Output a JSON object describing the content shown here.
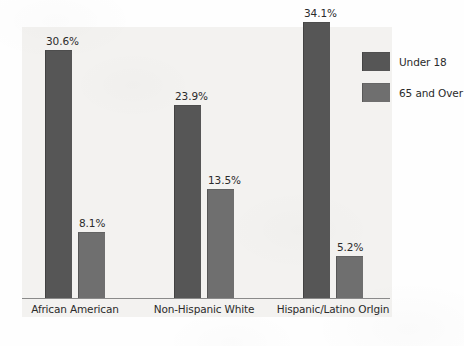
{
  "chart_data": {
    "type": "bar",
    "title": "",
    "subtitle": "",
    "xlabel": "",
    "ylabel": "",
    "grid": false,
    "legend_position": "right",
    "axis": {
      "y_axis_visible": false,
      "x_axis_visible": true,
      "ylim": [
        0,
        35.8
      ],
      "value_suffix": "%"
    },
    "categories": [
      "African American",
      "Non-Hispanic White",
      "Hispanic/Latino OrIgin"
    ],
    "series": [
      {
        "name": "Under 18",
        "color": "#565656",
        "values": [
          30.6,
          23.9,
          34.1
        ],
        "labels": [
          "30.6%",
          "23.9%",
          "34.1%"
        ]
      },
      {
        "name": "65 and Over",
        "color": "#6f6f6f",
        "values": [
          8.1,
          13.5,
          5.2
        ],
        "labels": [
          "8.1%",
          "13.5%",
          "5.2%"
        ]
      }
    ]
  },
  "legend": {
    "items": [
      {
        "label": "Under 18",
        "color": "#565656"
      },
      {
        "label": "65 and Over",
        "color": "#6f6f6f"
      }
    ]
  },
  "colors": {
    "page_background": "#fefefe",
    "panel_background": "#f3f2f0",
    "baseline": "#8a8a8a",
    "text": "#2b2b2b",
    "series_under_18": "#565656",
    "series_65_and_over": "#6f6f6f"
  }
}
